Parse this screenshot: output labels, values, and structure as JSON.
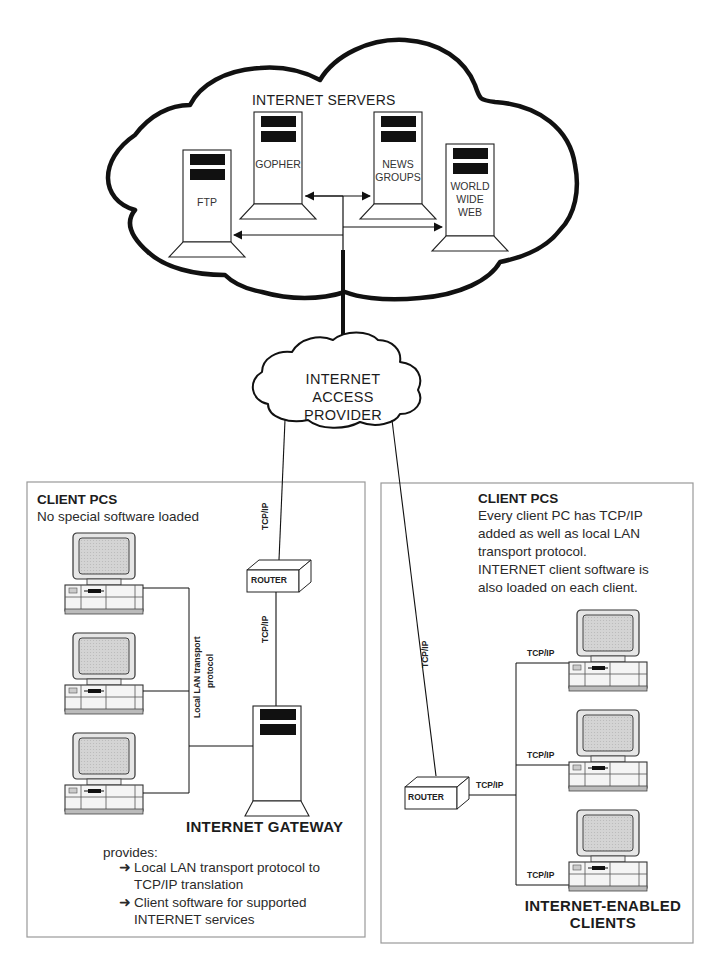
{
  "internet_servers_cloud": {
    "title": "INTERNET SERVERS",
    "servers": [
      {
        "label_lines": [
          "FTP"
        ]
      },
      {
        "label_lines": [
          "GOPHER"
        ]
      },
      {
        "label_lines": [
          "NEWS",
          "GROUPS"
        ]
      },
      {
        "label_lines": [
          "WORLD",
          "WIDE",
          "WEB"
        ]
      }
    ]
  },
  "access_provider_cloud": {
    "label_lines": [
      "INTERNET",
      "ACCESS",
      "PROVIDER"
    ]
  },
  "left_panel": {
    "heading": "CLIENT PCS",
    "subheading": "No special software loaded",
    "lan_label_line1": "Local LAN transport",
    "lan_label_line2": "protocol",
    "router_label": "ROUTER",
    "link_upper_label": "TCP/IP",
    "link_lower_label": "TCP/IP",
    "gateway_title": "INTERNET GATEWAY",
    "provides_label": "provides:",
    "bullets": [
      {
        "arrow": "➜",
        "lines": [
          "Local LAN transport protocol to",
          "TCP/IP translation"
        ]
      },
      {
        "arrow": "➜",
        "lines": [
          "Client software for supported",
          "INTERNET services"
        ]
      }
    ]
  },
  "right_panel": {
    "heading": "CLIENT PCS",
    "description_lines": [
      "Every client PC has TCP/IP",
      "added as well as local LAN",
      "transport protocol.",
      "INTERNET client software is",
      "also loaded on each client."
    ],
    "uplink_label": "TCP/IP",
    "router_label": "ROUTER",
    "router_link_label": "TCP/IP",
    "client_link_labels": [
      "TCP/IP",
      "TCP/IP",
      "TCP/IP"
    ],
    "footer_lines": [
      "INTERNET-ENABLED",
      "CLIENTS"
    ]
  },
  "colors": {
    "line": "#111111",
    "panel_border": "#9a9a9a",
    "screen_fill": "#cfcfcf",
    "server_block": "#111111"
  }
}
